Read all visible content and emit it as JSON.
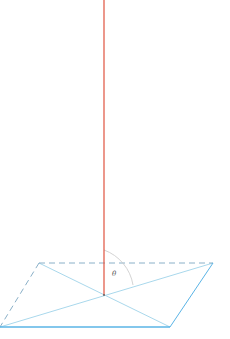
{
  "diagram": {
    "title": "",
    "angle_label": "θ",
    "colors": {
      "normal_line": "#e0533f",
      "plane_edge": "#5ab4e6",
      "plane_dashed": "#8ab0c8",
      "diagonal": "#a9d8ec",
      "arc": "#c8c8c8",
      "background": "#ffffff"
    },
    "elements": [
      {
        "name": "normal-line",
        "type": "line",
        "description": "vertical red line perpendicular to plane"
      },
      {
        "name": "plane",
        "type": "parallelogram",
        "corners": [
          [
            39,
            263
          ],
          [
            213,
            263
          ],
          [
            170,
            327
          ],
          [
            0,
            327
          ]
        ]
      },
      {
        "name": "diagonals",
        "type": "lines",
        "intersection": [
          104,
          295
        ]
      },
      {
        "name": "angle-arc",
        "type": "arc",
        "label": "θ"
      }
    ]
  }
}
